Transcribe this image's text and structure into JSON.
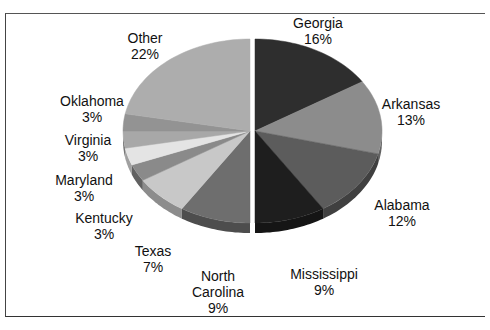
{
  "chart_data": {
    "type": "pie",
    "style": "3d-exploded",
    "title": "",
    "categories": [
      "Georgia",
      "Arkansas",
      "Alabama",
      "Mississippi",
      "North Carolina",
      "Texas",
      "Kentucky",
      "Maryland",
      "Virginia",
      "Oklahoma",
      "Other"
    ],
    "values": [
      16,
      13,
      12,
      9,
      9,
      7,
      3,
      3,
      3,
      3,
      22
    ],
    "unit": "%",
    "legend": "none (data labels on slices)",
    "colors": [
      "#2e2e2e",
      "#8c8c8c",
      "#5c5c5c",
      "#1e1e1e",
      "#6e6e6e",
      "#c8c8c8",
      "#8a8a8a",
      "#e4e4e4",
      "#a8a8a8",
      "#939393",
      "#adadad"
    ]
  },
  "labels": {
    "georgia": {
      "name": "Georgia",
      "pct": "16%"
    },
    "arkansas": {
      "name": "Arkansas",
      "pct": "13%"
    },
    "alabama": {
      "name": "Alabama",
      "pct": "12%"
    },
    "mississippi": {
      "name": "Mississippi",
      "pct": "9%"
    },
    "north_carolina": {
      "name1": "North",
      "name2": "Carolina",
      "pct": "9%"
    },
    "texas": {
      "name": "Texas",
      "pct": "7%"
    },
    "kentucky": {
      "name": "Kentucky",
      "pct": "3%"
    },
    "maryland": {
      "name": "Maryland",
      "pct": "3%"
    },
    "virginia": {
      "name": "Virginia",
      "pct": "3%"
    },
    "oklahoma": {
      "name": "Oklahoma",
      "pct": "3%"
    },
    "other": {
      "name": "Other",
      "pct": "22%"
    }
  }
}
